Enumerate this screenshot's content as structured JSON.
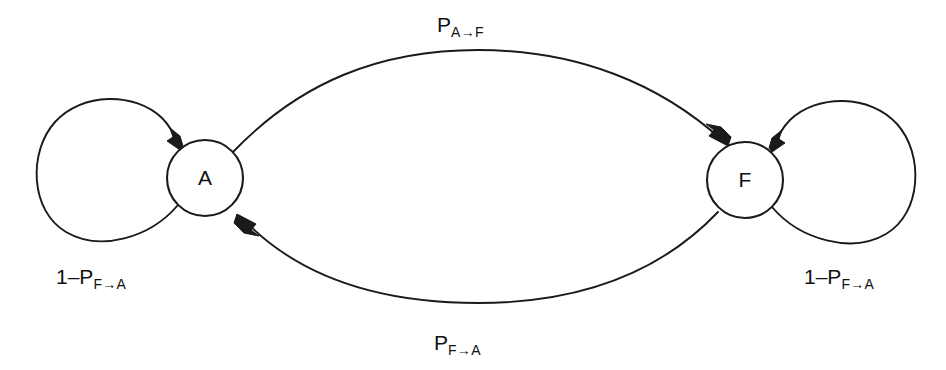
{
  "diagram": {
    "type": "state-transition-diagram",
    "background_color": "#ffffff",
    "stroke_color": "#1a1a1a",
    "text_color": "#111111",
    "nodes": [
      {
        "id": "A",
        "label": "A",
        "cx": 205,
        "cy": 178,
        "r": 38
      },
      {
        "id": "F",
        "label": "F",
        "cx": 745,
        "cy": 180,
        "r": 38
      }
    ],
    "edges": [
      {
        "id": "a-to-f",
        "from": "A",
        "to": "F",
        "label_base": "P",
        "label_sub": "A→F",
        "label_text": "P A→F",
        "position": "top"
      },
      {
        "id": "f-to-a",
        "from": "F",
        "to": "A",
        "label_base": "P",
        "label_sub": "F→A",
        "label_text": "P F→A",
        "position": "bottom"
      },
      {
        "id": "loop-a",
        "from": "A",
        "to": "A",
        "label_base": "1–P",
        "label_sub": "F→A",
        "label_text": "1–P F→A",
        "position": "left"
      },
      {
        "id": "loop-f",
        "from": "F",
        "to": "F",
        "label_base": "1–P",
        "label_sub": "F→A",
        "label_text": "1–P F→A",
        "position": "right"
      }
    ]
  }
}
